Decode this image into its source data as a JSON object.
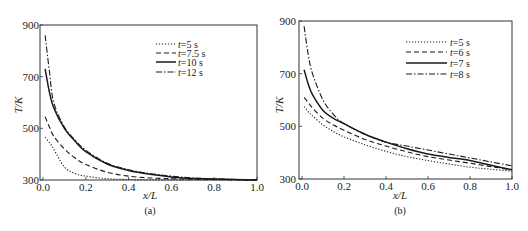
{
  "chart_data": [
    {
      "id": "a",
      "type": "line",
      "caption": "(a)",
      "title": "",
      "xlabel": "x/L",
      "ylabel": "T/K",
      "xlim": [
        0.0,
        1.0
      ],
      "ylim": [
        300,
        900
      ],
      "xticks": [
        "0.0",
        "0.2",
        "0.4",
        "0.6",
        "0.8",
        "1.0"
      ],
      "yticks": [
        "300",
        "500",
        "700",
        "900"
      ],
      "grid": false,
      "legend_position": "upper right",
      "x": [
        0.01,
        0.03,
        0.05,
        0.1,
        0.15,
        0.2,
        0.3,
        0.4,
        0.5,
        0.6,
        0.7,
        0.8,
        0.9,
        1.0
      ],
      "series": [
        {
          "name": "t=5 s",
          "style": "dotted",
          "values": [
            465,
            445,
            420,
            350,
            325,
            315,
            305,
            302,
            301,
            300,
            300,
            300,
            300,
            300
          ]
        },
        {
          "name": "t=7.5 s",
          "style": "dashed",
          "values": [
            545,
            505,
            470,
            420,
            385,
            360,
            330,
            315,
            308,
            305,
            303,
            302,
            301,
            300
          ]
        },
        {
          "name": "t=10 s",
          "style": "solid",
          "values": [
            730,
            640,
            580,
            500,
            450,
            410,
            362,
            337,
            322,
            312,
            306,
            304,
            302,
            300
          ]
        },
        {
          "name": "t=12 s",
          "style": "dashdot",
          "values": [
            860,
            720,
            600,
            505,
            455,
            415,
            365,
            340,
            325,
            315,
            308,
            305,
            302,
            300
          ]
        }
      ]
    },
    {
      "id": "b",
      "type": "line",
      "caption": "(b)",
      "title": "",
      "xlabel": "x/L",
      "ylabel": "T/K",
      "xlim": [
        0.0,
        1.0
      ],
      "ylim": [
        300,
        900
      ],
      "xticks": [
        "0.0",
        "0.2",
        "0.4",
        "0.6",
        "0.8",
        "1.0"
      ],
      "yticks": [
        "300",
        "500",
        "700",
        "900"
      ],
      "grid": false,
      "legend_position": "upper right",
      "x": [
        0.01,
        0.03,
        0.05,
        0.1,
        0.15,
        0.2,
        0.3,
        0.4,
        0.5,
        0.6,
        0.7,
        0.8,
        0.9,
        1.0
      ],
      "series": [
        {
          "name": "t=5 s",
          "style": "dotted",
          "values": [
            575,
            555,
            540,
            505,
            480,
            460,
            430,
            405,
            385,
            370,
            357,
            345,
            337,
            330
          ]
        },
        {
          "name": "t=6 s",
          "style": "dashed",
          "values": [
            610,
            590,
            570,
            530,
            505,
            485,
            450,
            425,
            403,
            385,
            372,
            360,
            347,
            335
          ]
        },
        {
          "name": "t=7 s",
          "style": "solid",
          "values": [
            715,
            660,
            620,
            560,
            530,
            510,
            470,
            440,
            415,
            395,
            382,
            370,
            352,
            335
          ]
        },
        {
          "name": "t=8 s",
          "style": "dashdot",
          "values": [
            880,
            770,
            700,
            600,
            545,
            510,
            470,
            440,
            425,
            410,
            395,
            380,
            365,
            350
          ]
        }
      ]
    }
  ]
}
